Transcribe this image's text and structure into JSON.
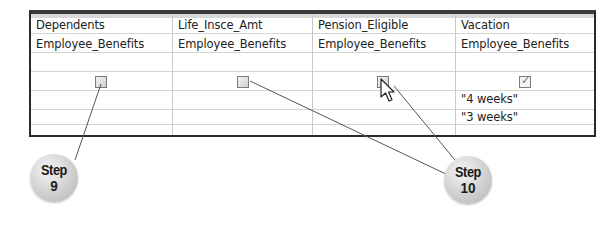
{
  "grid": {
    "columns": [
      {
        "field": "Dependents",
        "table": "Employee_Benefits",
        "criteria_checkbox": false,
        "criteria": []
      },
      {
        "field": "Life_Insce_Amt",
        "table": "Employee_Benefits",
        "criteria_checkbox": false,
        "criteria": []
      },
      {
        "field": "Pension_Eligible",
        "table": "Employee_Benefits",
        "criteria_checkbox": false,
        "criteria": []
      },
      {
        "field": "Vacation",
        "table": "Employee_Benefits",
        "criteria_checkbox": true,
        "criteria": [
          "\"4 weeks\"",
          "\"3 weeks\""
        ]
      }
    ]
  },
  "callouts": {
    "step9": {
      "line1": "Step",
      "line2": "9"
    },
    "step10": {
      "line1": "Step",
      "line2": "10"
    }
  },
  "icons": {
    "cursor": "mouse-pointer-icon",
    "check": "checkmark-icon"
  },
  "colors": {
    "grid_border": "#2a2a2a",
    "grid_lines": "#d4d4d4",
    "callout": "#c8c8c8",
    "leader_line": "#555555"
  }
}
